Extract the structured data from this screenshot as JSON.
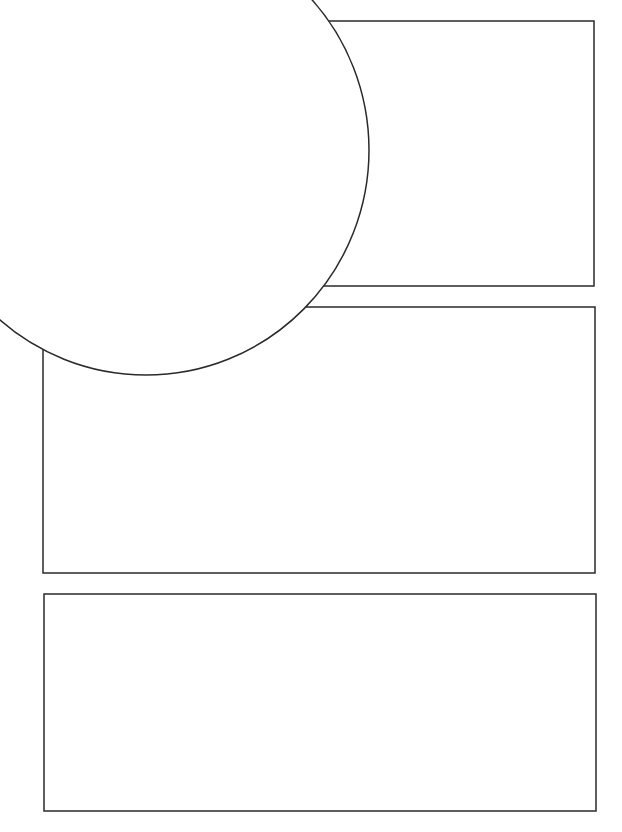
{
  "page": {
    "type": "comic-panel-template",
    "background": "#ffffff",
    "stroke_color": "#2a2a2a",
    "stroke_width": 1.5
  },
  "panels": [
    {
      "id": "panel-1",
      "x": 320,
      "y": 21,
      "width": 274,
      "height": 265
    },
    {
      "id": "panel-2",
      "x": 43,
      "y": 307,
      "width": 552,
      "height": 266
    },
    {
      "id": "panel-3",
      "x": 44,
      "y": 594,
      "width": 552,
      "height": 217
    }
  ],
  "bubble": {
    "id": "circle-bubble",
    "cx": 146,
    "cy": 150,
    "rx": 223,
    "ry": 225
  }
}
